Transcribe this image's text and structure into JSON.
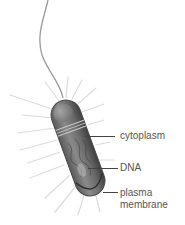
{
  "diagram": {
    "labels": [
      {
        "id": "cytoplasm",
        "text": "cytoplasm"
      },
      {
        "id": "dna",
        "text": "DNA"
      },
      {
        "id": "plasma-membrane",
        "text_line1": "plasma",
        "text_line2": "membrane"
      }
    ],
    "parts": [
      "flagellum",
      "pili",
      "cell-body"
    ],
    "colors": {
      "body_dark": "#4a4a4a",
      "body_mid": "#7a7a7a",
      "body_light": "#b0b0b0",
      "pili": "#d8d8d8",
      "flagellum": "#9a9a9a",
      "leader": "#444444",
      "label_text": "#555555"
    }
  }
}
